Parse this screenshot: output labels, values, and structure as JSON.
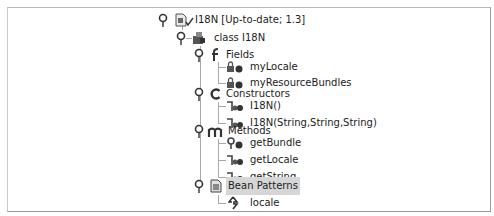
{
  "tree": {
    "root": {
      "label": "I18N [Up-to-date; 1.3]",
      "icon": "java-file-icon",
      "status_icon": "checkmark-icon"
    },
    "class": {
      "label": "class I18N",
      "icon": "class-icon"
    },
    "categories": [
      {
        "key": "fields",
        "label": "Fields",
        "icon": "fields-category-icon",
        "children": [
          {
            "label": "myLocale",
            "icon": "private-field-icon"
          },
          {
            "label": "myResourceBundles",
            "icon": "private-field-icon"
          }
        ]
      },
      {
        "key": "constructors",
        "label": "Constructors",
        "icon": "constructors-category-icon",
        "children": [
          {
            "label": "I18N()",
            "icon": "constructor-icon"
          },
          {
            "label": "I18N(String,String,String)",
            "icon": "constructor-icon"
          }
        ]
      },
      {
        "key": "methods",
        "label": "Methods",
        "icon": "methods-category-icon",
        "children": [
          {
            "label": "getBundle",
            "icon": "protected-method-icon"
          },
          {
            "label": "getLocale",
            "icon": "public-method-icon"
          },
          {
            "label": "getString",
            "icon": "public-method-icon"
          }
        ]
      },
      {
        "key": "bean_patterns",
        "label": "Bean Patterns",
        "icon": "bean-patterns-icon",
        "selected": true,
        "children": [
          {
            "label": "locale",
            "icon": "bean-property-icon"
          }
        ]
      }
    ]
  },
  "colors": {
    "selection": "#d6d6d6",
    "tree_line": "#a8a8a8",
    "icon_dark": "#3a3a3a"
  }
}
